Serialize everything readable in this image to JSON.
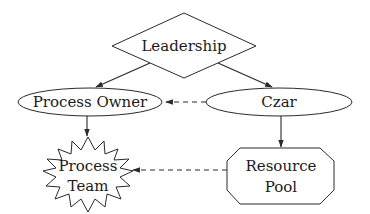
{
  "diagram": {
    "nodes": {
      "leadership": {
        "label": "Leadership",
        "shape": "diamond"
      },
      "process_owner": {
        "label": "Process Owner",
        "shape": "ellipse"
      },
      "czar": {
        "label": "Czar",
        "shape": "ellipse"
      },
      "process_team": {
        "line1": "Process",
        "line2": "Team",
        "shape": "star"
      },
      "resource_pool": {
        "line1": "Resource",
        "line2": "Pool",
        "shape": "octagon"
      }
    },
    "edges": [
      {
        "from": "Leadership",
        "to": "Process Owner",
        "style": "solid"
      },
      {
        "from": "Leadership",
        "to": "Czar",
        "style": "solid"
      },
      {
        "from": "Czar",
        "to": "Process Owner",
        "style": "dashed"
      },
      {
        "from": "Process Owner",
        "to": "Process Team",
        "style": "solid"
      },
      {
        "from": "Czar",
        "to": "Resource Pool",
        "style": "solid"
      },
      {
        "from": "Resource Pool",
        "to": "Process Team",
        "style": "dashed"
      }
    ],
    "colors": {
      "stroke": "#2a2a2a",
      "fill": "#ffffff",
      "text": "#1a1a1a"
    }
  }
}
